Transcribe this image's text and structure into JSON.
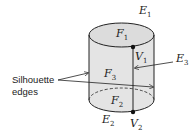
{
  "diagram": {
    "faces": [
      {
        "name": "F",
        "sub": "1"
      },
      {
        "name": "F",
        "sub": "2"
      },
      {
        "name": "F",
        "sub": "3"
      }
    ],
    "edges": [
      {
        "name": "E",
        "sub": "1"
      },
      {
        "name": "E",
        "sub": "2"
      },
      {
        "name": "E",
        "sub": "3"
      }
    ],
    "vertices": [
      {
        "name": "V",
        "sub": "1"
      },
      {
        "name": "V",
        "sub": "2"
      }
    ],
    "annotation": {
      "line1": "Silhouette",
      "line2": "edges"
    },
    "colors": {
      "fill": "#e4e4e4",
      "stroke": "#222222"
    }
  }
}
